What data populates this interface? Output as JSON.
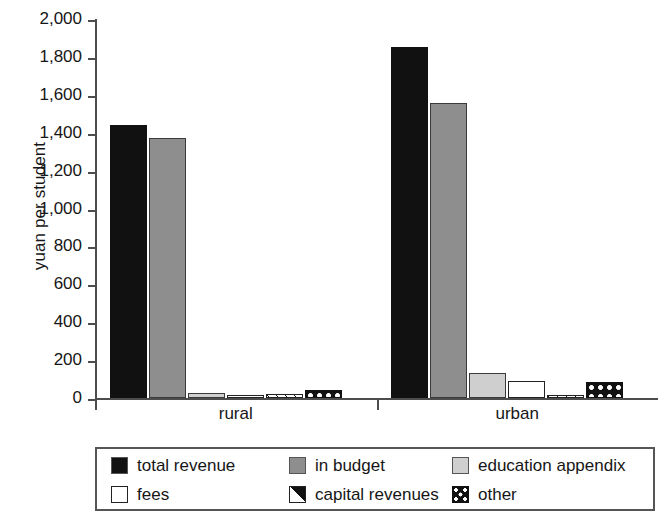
{
  "chart_data": {
    "type": "bar",
    "title": "",
    "subtitle": "",
    "xlabel": "",
    "ylabel": "yuan per student",
    "ylim": [
      0,
      2000
    ],
    "ytick_step": 200,
    "ytick_labels": [
      "2,000",
      "1,800",
      "1,600",
      "1,400",
      "1,200",
      "1,000",
      "800",
      "600",
      "400",
      "200",
      "0"
    ],
    "ytick_values": [
      2000,
      1800,
      1600,
      1400,
      1200,
      1000,
      800,
      600,
      400,
      200,
      0
    ],
    "grid": false,
    "legend_position": "bottom",
    "categories": [
      "rural",
      "urban"
    ],
    "series": [
      {
        "name": "total revenue",
        "values": [
          1440,
          1850
        ]
      },
      {
        "name": "in budget",
        "values": [
          1370,
          1555
        ]
      },
      {
        "name": "education appendix",
        "values": [
          25,
          130
        ]
      },
      {
        "name": "fees",
        "values": [
          3,
          90
        ]
      },
      {
        "name": "capital revenues",
        "values": [
          22,
          15
        ]
      },
      {
        "name": "other",
        "values": [
          40,
          85
        ]
      }
    ]
  },
  "axis": {
    "y_title": "yuan per student"
  },
  "legend": {
    "items": [
      {
        "label": "total revenue",
        "pattern": "solid-black",
        "color": "#111111"
      },
      {
        "label": "in budget",
        "pattern": "solid-gray",
        "color": "#8e8e8e"
      },
      {
        "label": "education appendix",
        "pattern": "solid-light",
        "color": "#cfcfcf"
      },
      {
        "label": "fees",
        "pattern": "solid-white",
        "color": "#ffffff"
      },
      {
        "label": "capital revenues",
        "pattern": "diagonal-half",
        "color": "#111111"
      },
      {
        "label": "other",
        "pattern": "dotted-black",
        "color": "#111111"
      }
    ]
  }
}
